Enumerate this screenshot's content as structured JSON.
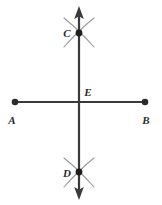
{
  "figure": {
    "width": 162,
    "height": 205,
    "background_color": "#ffffff",
    "stroke_color": "#3a3a3a",
    "arc_color": "#8e8e8e",
    "label_color": "#2b2b2b"
  },
  "labels": {
    "a": "A",
    "b": "B",
    "c": "C",
    "d": "D",
    "e": "E"
  },
  "points": [
    {
      "name": "A",
      "x": 15,
      "y": 102,
      "kind": "segment-endpoint-dot"
    },
    {
      "name": "B",
      "x": 145,
      "y": 102,
      "kind": "segment-endpoint-dot"
    },
    {
      "name": "C",
      "x": 79,
      "y": 33,
      "kind": "construction-dot"
    },
    {
      "name": "D",
      "x": 79,
      "y": 172,
      "kind": "construction-dot"
    },
    {
      "name": "E",
      "x": 79,
      "y": 102,
      "kind": "intersection"
    }
  ],
  "label_positions": [
    {
      "name": "A",
      "x": 12,
      "y": 122,
      "anchor": "middle"
    },
    {
      "name": "B",
      "x": 145,
      "y": 122,
      "anchor": "middle"
    },
    {
      "name": "C",
      "x": 67,
      "y": 36,
      "anchor": "middle"
    },
    {
      "name": "D",
      "x": 67,
      "y": 176,
      "anchor": "middle"
    },
    {
      "name": "E",
      "x": 87,
      "y": 96,
      "anchor": "middle"
    }
  ],
  "lines": {
    "horizontal_segment": {
      "x1": 15,
      "y1": 102,
      "x2": 145,
      "y2": 102
    },
    "vertical_line": {
      "x1": 79,
      "y1": 8,
      "x2": 79,
      "y2": 198,
      "arrow_start": true,
      "arrow_end": true
    }
  },
  "arcs": {
    "at_c": [
      {
        "x1": 65,
        "y1": 19,
        "x2": 93,
        "y2": 47
      },
      {
        "x1": 93,
        "y1": 19,
        "x2": 65,
        "y2": 47
      }
    ],
    "at_d": [
      {
        "x1": 65,
        "y1": 158,
        "x2": 93,
        "y2": 186
      },
      {
        "x1": 93,
        "y1": 158,
        "x2": 65,
        "y2": 186
      }
    ]
  }
}
